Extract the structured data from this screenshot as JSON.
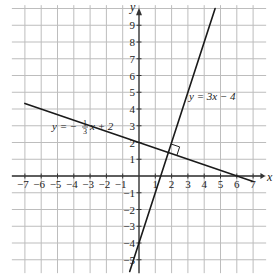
{
  "chart_data": {
    "type": "line",
    "title": "",
    "xlabel": "x",
    "ylabel": "y",
    "xlim": [
      -7,
      7
    ],
    "ylim": [
      -5,
      9
    ],
    "grid": true,
    "x_ticks": [
      -7,
      -6,
      -5,
      -4,
      -3,
      -2,
      -1,
      1,
      2,
      3,
      4,
      5,
      6,
      7
    ],
    "y_ticks": [
      9,
      8,
      7,
      6,
      5,
      4,
      3,
      2,
      1,
      -1,
      -2,
      -3,
      -4,
      -5
    ],
    "series": [
      {
        "name": "y = -1/3 x + 2",
        "label_parts": {
          "lhs": "y = −",
          "num": "1",
          "den": "3",
          "rhs": "x + 2"
        },
        "slope": -0.3333,
        "intercept": 2,
        "x": [
          -7,
          7
        ],
        "y": [
          4.333,
          -0.333
        ]
      },
      {
        "name": "y = 3x − 4",
        "label": "y = 3x − 4",
        "slope": 3,
        "intercept": -4,
        "x": [
          -0.57,
          4.67
        ],
        "y": [
          -5.7,
          10
        ]
      }
    ],
    "annotations": [
      {
        "type": "right-angle-marker",
        "at": {
          "x": 1.8,
          "y": 1.4
        },
        "note": "lines are perpendicular"
      }
    ]
  },
  "labels": {
    "x_axis": "x",
    "y_axis": "y",
    "line1_lhs": "y = −",
    "line1_num": "1",
    "line1_den": "3",
    "line1_rhs": "x + 2",
    "line2": "y = 3x − 4"
  }
}
